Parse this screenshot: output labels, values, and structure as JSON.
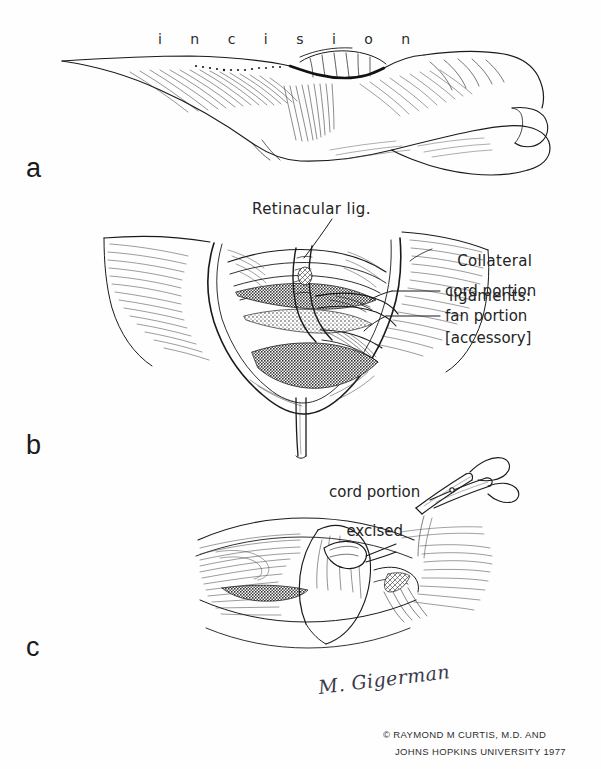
{
  "figure": {
    "background_color": "#fefefe",
    "ink_color": "#1a1a1a"
  },
  "panels": [
    {
      "letter": "a",
      "caption": "Lateral view of finger showing planned incision",
      "labels": [
        "incision"
      ]
    },
    {
      "letter": "b",
      "caption": "Open dissection exposing retinacular and collateral ligaments",
      "labels": [
        "Retinacular lig.",
        "Collateral ligaments:",
        "cord portion",
        "fan portion",
        "[accessory]"
      ]
    },
    {
      "letter": "c",
      "caption": "Cord portion excised with scissors",
      "labels": [
        "cord portion excised"
      ]
    }
  ],
  "labels": {
    "incision": "i n c i s i o n",
    "retinacular": "Retinacular lig.",
    "collateral_line1": "Collateral",
    "collateral_line2": "ligaments:",
    "cord_portion": "cord portion",
    "fan_portion": "fan portion",
    "accessory": "[accessory]",
    "excised_line1": "cord portion",
    "excised_line2": "excised"
  },
  "panel_letters": {
    "a": "a",
    "b": "b",
    "c": "c"
  },
  "credits": {
    "signature": "M. Gigerman",
    "copyright_line1": "© RAYMOND M CURTIS, M.D. AND",
    "copyright_line2": "JOHNS HOPKINS UNIVERSITY  1977"
  }
}
